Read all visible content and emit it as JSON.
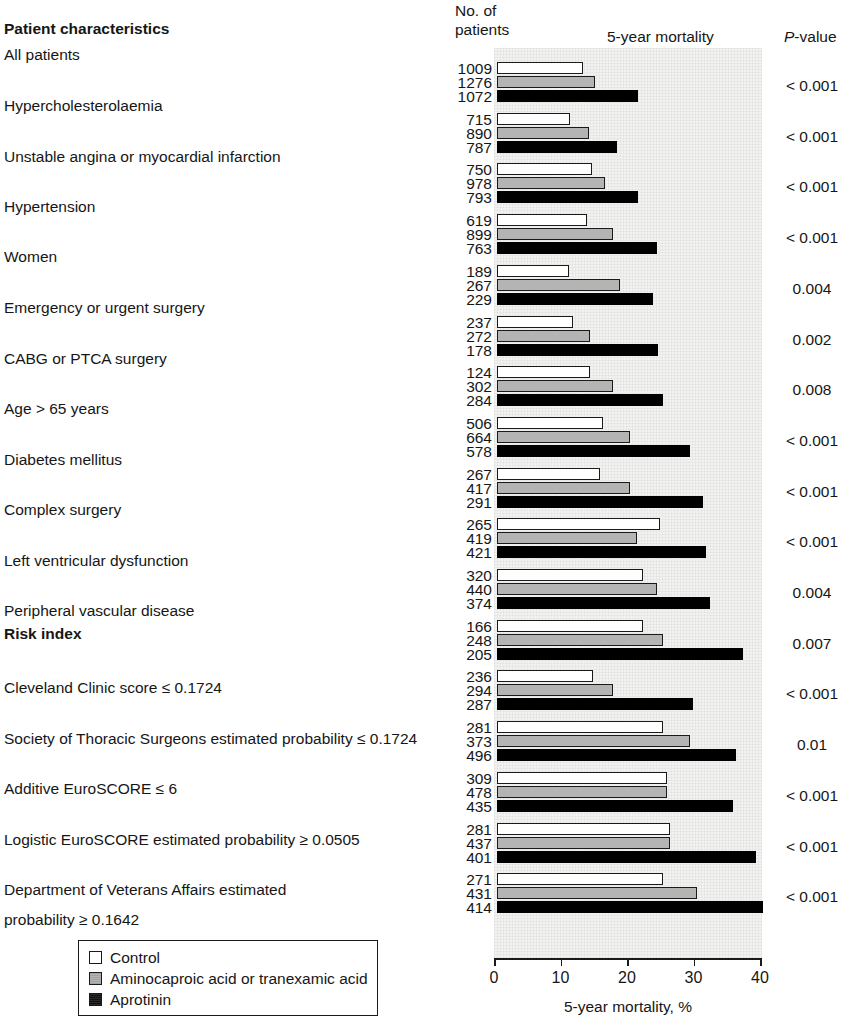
{
  "header": {
    "characteristics": "Patient characteristics",
    "no_of_patients": "No. of patients",
    "mortality": "5-year mortality",
    "pvalue_italic": "P",
    "pvalue_rest": "-value"
  },
  "section_headings": [
    {
      "label": "Patient characteristics",
      "after_group": -1
    },
    {
      "label": "Risk index",
      "after_group": 10
    }
  ],
  "legend": {
    "items": [
      {
        "key": "control",
        "label": "Control",
        "color": "#ffffff"
      },
      {
        "key": "amino",
        "label": "Aminocaproic acid or tranexamic acid",
        "color": "#b4b4b4"
      },
      {
        "key": "aprotinin",
        "label": "Aprotinin",
        "color": "#000000"
      }
    ]
  },
  "axis": {
    "title": "5-year mortality, %",
    "ticks": [
      "0",
      "10",
      "20",
      "30",
      "40"
    ],
    "min": 0,
    "max": 40
  },
  "chart_data": {
    "type": "bar",
    "orientation": "horizontal",
    "title": "5-year mortality",
    "xlabel": "5-year mortality, %",
    "ylabel": "Patient characteristics",
    "xlim": [
      0,
      40
    ],
    "grid": false,
    "legend_position": "bottom-left",
    "series": [
      {
        "name": "Control",
        "color": "#ffffff"
      },
      {
        "name": "Aminocaproic acid or tranexamic acid",
        "color": "#b4b4b4"
      },
      {
        "name": "Aprotinin",
        "color": "#000000"
      }
    ],
    "categories": [
      "All patients",
      "Hypercholesterolaemia",
      "Unstable angina or myocardial infarction",
      "Hypertension",
      "Women",
      "Emergency or urgent surgery",
      "CABG or PTCA surgery",
      "Age > 65 years",
      "Diabetes mellitus",
      "Complex surgery",
      "Left ventricular dysfunction",
      "Peripheral vascular disease",
      "Cleveland Clinic score ≤ 0.1724",
      "Society of Thoracic Surgeons estimated probability ≤ 0.1724",
      "Additive EuroSCORE ≤ 6",
      "Logistic EuroSCORE estimated probability ≥ 0.0505",
      "Department of Veterans Affairs estimated probability ≥ 0.1642"
    ],
    "rows": [
      {
        "label": "All patients",
        "n": [
          1009,
          1276,
          1072
        ],
        "values": [
          13.0,
          14.8,
          21.2
        ],
        "p": "< 0.001"
      },
      {
        "label": "Hypercholesterolaemia",
        "n": [
          715,
          890,
          787
        ],
        "values": [
          11.0,
          13.8,
          18.0
        ],
        "p": "< 0.001"
      },
      {
        "label": "Unstable angina or myocardial infarction",
        "n": [
          750,
          978,
          793
        ],
        "values": [
          14.3,
          16.3,
          21.2
        ],
        "p": "< 0.001"
      },
      {
        "label": "Hypertension",
        "n": [
          619,
          899,
          763
        ],
        "values": [
          13.5,
          17.5,
          24.0
        ],
        "p": "< 0.001"
      },
      {
        "label": "Women",
        "n": [
          189,
          267,
          229
        ],
        "values": [
          10.8,
          18.5,
          23.5
        ],
        "p": "0.004"
      },
      {
        "label": "Emergency or urgent surgery",
        "n": [
          237,
          272,
          178
        ],
        "values": [
          11.5,
          14.0,
          24.2
        ],
        "p": "0.002"
      },
      {
        "label": "CABG or PTCA surgery",
        "n": [
          124,
          302,
          284
        ],
        "values": [
          14.0,
          17.5,
          25.0
        ],
        "p": "0.008"
      },
      {
        "label": "Age > 65 years",
        "n": [
          506,
          664,
          578
        ],
        "values": [
          16.0,
          20.0,
          29.0
        ],
        "p": "< 0.001"
      },
      {
        "label": "Diabetes mellitus",
        "n": [
          267,
          417,
          291
        ],
        "values": [
          15.5,
          20.0,
          31.0
        ],
        "p": "< 0.001"
      },
      {
        "label": "Complex surgery",
        "n": [
          265,
          419,
          421
        ],
        "values": [
          24.5,
          21.0,
          31.5
        ],
        "p": "< 0.001"
      },
      {
        "label": "Left ventricular dysfunction",
        "n": [
          320,
          440,
          374
        ],
        "values": [
          22.0,
          24.0,
          32.0
        ],
        "p": "0.004"
      },
      {
        "label": "Peripheral vascular disease",
        "n": [
          166,
          248,
          205
        ],
        "values": [
          22.0,
          25.0,
          37.0
        ],
        "p": "0.007"
      },
      {
        "label": "Cleveland Clinic score ≤ 0.1724",
        "n": [
          236,
          294,
          287
        ],
        "values": [
          14.5,
          17.5,
          29.5
        ],
        "p": "< 0.001"
      },
      {
        "label": "Society of Thoracic Surgeons estimated probability ≤ 0.1724",
        "n": [
          281,
          373,
          496
        ],
        "values": [
          25.0,
          29.0,
          36.0
        ],
        "p": "0.01"
      },
      {
        "label": "Additive EuroSCORE ≤ 6",
        "n": [
          309,
          478,
          435
        ],
        "values": [
          25.5,
          25.5,
          35.5
        ],
        "p": "< 0.001"
      },
      {
        "label": "Logistic EuroSCORE estimated probability ≥ 0.0505",
        "n": [
          281,
          437,
          401
        ],
        "values": [
          26.0,
          26.0,
          39.0
        ],
        "p": "< 0.001"
      },
      {
        "label": "Department of Veterans Affairs estimated probability ≥ 0.1642",
        "n": [
          271,
          431,
          414
        ],
        "values": [
          25.0,
          30.0,
          40.0
        ],
        "p": "< 0.001"
      }
    ]
  },
  "left_labels": [
    {
      "text": "Patient characteristics",
      "top": 20,
      "bold": true
    },
    {
      "text": "All patients",
      "top": 45,
      "bold": false
    },
    {
      "text": "Hypercholesterolaemia",
      "top": 96,
      "bold": false
    },
    {
      "text": "Unstable angina or myocardial infarction",
      "top": 147,
      "bold": false
    },
    {
      "text": "Hypertension",
      "top": 197,
      "bold": false
    },
    {
      "text": "Women",
      "top": 247,
      "bold": false
    },
    {
      "text": "Emergency or urgent surgery",
      "top": 298,
      "bold": false
    },
    {
      "text": "CABG or PTCA surgery",
      "top": 349,
      "bold": false
    },
    {
      "text": "Age > 65 years",
      "top": 399,
      "bold": false
    },
    {
      "text": "Diabetes mellitus",
      "top": 450,
      "bold": false
    },
    {
      "text": "Complex surgery",
      "top": 500,
      "bold": false
    },
    {
      "text": "Left ventricular dysfunction",
      "top": 551,
      "bold": false
    },
    {
      "text": "Peripheral vascular disease",
      "top": 601,
      "bold": false
    },
    {
      "text": "Risk index",
      "top": 624,
      "bold": true
    },
    {
      "text": "Cleveland Clinic score ≤ 0.1724",
      "top": 678,
      "bold": false
    },
    {
      "text": "Society of Thoracic Surgeons estimated probability ≤ 0.1724",
      "top": 729,
      "bold": false
    },
    {
      "text": "Additive EuroSCORE ≤ 6",
      "top": 779,
      "bold": false
    },
    {
      "text": "Logistic EuroSCORE estimated probability ≥ 0.0505",
      "top": 830,
      "bold": false
    },
    {
      "text": "Department of Veterans Affairs estimated",
      "top": 880,
      "bold": false
    },
    {
      "text": "probability ≥ 0.1642",
      "top": 910,
      "bold": false
    }
  ]
}
